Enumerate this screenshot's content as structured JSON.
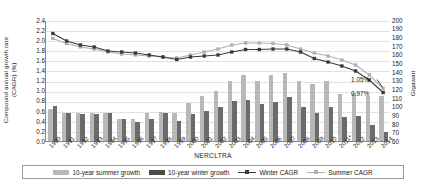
{
  "chart_data": {
    "type": "bar",
    "title": "",
    "xlabel": "NERCLTRA",
    "ylabel": "Compound annual growth rate\n(CAGR) (%)",
    "ylabel_right": "Gigawatt",
    "categories": [
      "1990",
      "1991",
      "1992",
      "1993",
      "1994",
      "1995",
      "1996",
      "1997",
      "1998",
      "1999",
      "2000",
      "2001",
      "2002",
      "2003",
      "2004",
      "2005",
      "2006",
      "2007",
      "2008",
      "2009",
      "2010",
      "2011*",
      "2012",
      "2013",
      "2014"
    ],
    "ylim": [
      0.0,
      2.4
    ],
    "ylim_right": [
      60,
      200
    ],
    "yticks": [
      "0.0",
      "0.2",
      "0.4",
      "0.6",
      "0.8",
      "1.0",
      "1.2",
      "1.4",
      "1.6",
      "1.8",
      "2.0",
      "2.2",
      "2.4"
    ],
    "yticks_right": [
      "60",
      "70",
      "80",
      "90",
      "100",
      "110",
      "120",
      "130",
      "140",
      "150",
      "160",
      "170",
      "180",
      "190",
      "200"
    ],
    "grid": true,
    "legend_position": "bottom",
    "series": [
      {
        "name": "10-year summer growth",
        "type": "bar",
        "axis": "right",
        "color": "#b8b8b8",
        "values": [
          97,
          92,
          92,
          92,
          92,
          85,
          86,
          92,
          94,
          92,
          104,
          112,
          118,
          130,
          136,
          130,
          136,
          139,
          130,
          126,
          130,
          114,
          116,
          112,
          112
        ]
      },
      {
        "name": "10-year winter growth",
        "type": "bar",
        "axis": "right",
        "color": "#6b6b6b",
        "values": [
          100,
          92,
          91,
          91,
          92,
          86,
          82,
          86,
          92,
          83,
          91,
          95,
          99,
          106,
          108,
          103,
          105,
          111,
          99,
          92,
          99,
          88,
          89,
          78,
          71
        ]
      },
      {
        "name": "Winter CAGR",
        "type": "line",
        "axis": "left",
        "color": "#3a3a3a",
        "marker": "square",
        "values": [
          2.15,
          2.0,
          1.92,
          1.88,
          1.8,
          1.78,
          1.76,
          1.72,
          1.68,
          1.63,
          1.68,
          1.7,
          1.72,
          1.78,
          1.83,
          1.83,
          1.84,
          1.84,
          1.78,
          1.65,
          1.58,
          1.5,
          1.4,
          1.22,
          0.97
        ]
      },
      {
        "name": "Summer CAGR",
        "type": "line",
        "axis": "left",
        "color": "#b0b0b0",
        "marker": "square",
        "values": [
          2.05,
          1.95,
          1.88,
          1.84,
          1.78,
          1.74,
          1.72,
          1.7,
          1.68,
          1.66,
          1.72,
          1.78,
          1.84,
          1.92,
          1.96,
          1.96,
          1.95,
          1.92,
          1.84,
          1.76,
          1.7,
          1.62,
          1.52,
          1.32,
          1.05
        ]
      }
    ],
    "annotations": [
      {
        "text": "1.05%",
        "series": "Summer CAGR",
        "at": "2014"
      },
      {
        "text": "0.97%",
        "series": "Winter CAGR",
        "at": "2014"
      }
    ]
  },
  "colors": {
    "summer_bar": "#b8b8b8",
    "winter_bar": "#6b6b6b",
    "winter_line": "#3a3a3a",
    "summer_line": "#b0b0b0",
    "grid": "#e2e2e2",
    "axis": "#888888"
  }
}
